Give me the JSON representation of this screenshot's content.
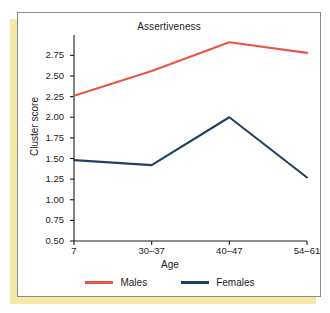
{
  "chart_data": {
    "type": "line",
    "title": "Assertiveness",
    "xlabel": "Age",
    "ylabel": "Cluster score",
    "categories": [
      "7",
      "30–37",
      "40–47",
      "54–61"
    ],
    "series": [
      {
        "name": "Males",
        "color": "#e8564a",
        "values": [
          2.26,
          2.56,
          2.91,
          2.78
        ]
      },
      {
        "name": "Females",
        "color": "#1f4263",
        "values": [
          1.48,
          1.42,
          2.0,
          1.27
        ]
      }
    ],
    "ylim": [
      0.5,
      2.9
    ],
    "yticks": [
      0.5,
      0.75,
      1.0,
      1.25,
      1.5,
      1.75,
      2.0,
      2.25,
      2.5,
      2.75
    ],
    "ytick_labels": [
      "0.50",
      "0.75",
      "1.00",
      "1.25",
      "1.50",
      "1.75",
      "2.00",
      "2.25",
      "2.50",
      "2.75"
    ],
    "grid": false,
    "legend_position": "bottom",
    "legend": [
      "Males",
      "Females"
    ]
  },
  "figure": {
    "panel_border_color": "#8c8c8c",
    "shadow_color": "#f6e9a8",
    "background_color": "#ffffff"
  }
}
